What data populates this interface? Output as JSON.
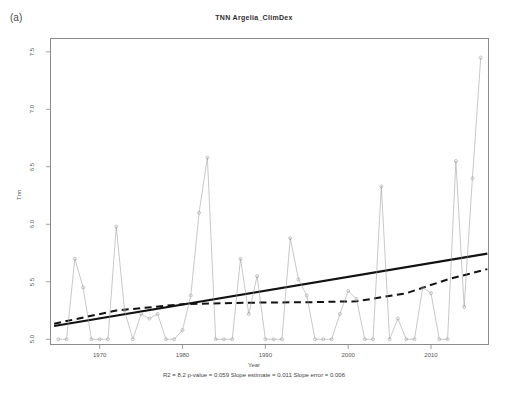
{
  "panel": {
    "label": "(a)"
  },
  "chart_data": {
    "type": "line",
    "title": "TNN  Argelia_ClimDex",
    "xlabel": "Year",
    "ylabel": "Tnn",
    "xlim": [
      1964,
      2017
    ],
    "ylim": [
      4.95,
      7.62
    ],
    "grid": false,
    "legend": null,
    "xticks": [
      1970,
      1980,
      1990,
      2000,
      2010
    ],
    "yticks": [
      5.0,
      5.5,
      6.0,
      6.5,
      7.0,
      7.5
    ],
    "ytick_labels": [
      "5.0",
      "5.5",
      "6.0",
      "6.5",
      "7.0",
      "7.5"
    ],
    "xtick_labels": [
      "1970",
      "1980",
      "1990",
      "2000",
      "2010"
    ],
    "marker": "open-circle",
    "series": [
      {
        "name": "Tnn annual",
        "style": "line-with-open-circles",
        "color": "#9a9a9a",
        "x": [
          1965,
          1966,
          1967,
          1968,
          1969,
          1970,
          1971,
          1972,
          1973,
          1974,
          1975,
          1976,
          1977,
          1978,
          1979,
          1980,
          1981,
          1982,
          1983,
          1984,
          1985,
          1986,
          1987,
          1988,
          1989,
          1990,
          1991,
          1992,
          1993,
          1994,
          1995,
          1996,
          1997,
          1998,
          1999,
          2000,
          2001,
          2002,
          2003,
          2004,
          2005,
          2006,
          2007,
          2008,
          2009,
          2010,
          2011,
          2012,
          2013,
          2014,
          2015,
          2016
        ],
        "y": [
          5.0,
          5.0,
          5.7,
          5.45,
          5.0,
          5.0,
          5.0,
          5.98,
          5.25,
          5.0,
          5.22,
          5.18,
          5.22,
          5.0,
          5.0,
          5.08,
          5.38,
          6.1,
          6.58,
          5.0,
          5.0,
          5.0,
          5.7,
          5.22,
          5.55,
          5.0,
          5.0,
          5.0,
          5.88,
          5.52,
          5.38,
          5.0,
          5.0,
          5.0,
          5.22,
          5.42,
          5.35,
          5.0,
          5.0,
          6.33,
          5.0,
          5.18,
          5.0,
          5.0,
          5.45,
          5.4,
          5.0,
          5.0,
          6.55,
          5.28,
          6.4,
          7.45
        ]
      },
      {
        "name": "Linear trend",
        "style": "solid",
        "color": "#111111",
        "x": [
          1964.5,
          2016.8
        ],
        "y": [
          5.115,
          5.745
        ]
      },
      {
        "name": "Smoothed trend",
        "style": "dashed",
        "color": "#111111",
        "x": [
          1964.5,
          1972,
          1980,
          1988,
          1995,
          2001,
          2007,
          2012,
          2016.8
        ],
        "y": [
          5.135,
          5.25,
          5.305,
          5.318,
          5.322,
          5.33,
          5.4,
          5.52,
          5.61
        ]
      }
    ],
    "stats": {
      "r2_label": "R2 = 8.2",
      "pvalue_label": "p-value = 0.059",
      "slope_estimate_label": "Slope estimate = 0.011",
      "slope_error_label": "Slope error = 0.006",
      "full_line": "R2 = 8.2  p-value = 0.059  Slope estimate = 0.011  Slope error = 0.006"
    }
  }
}
